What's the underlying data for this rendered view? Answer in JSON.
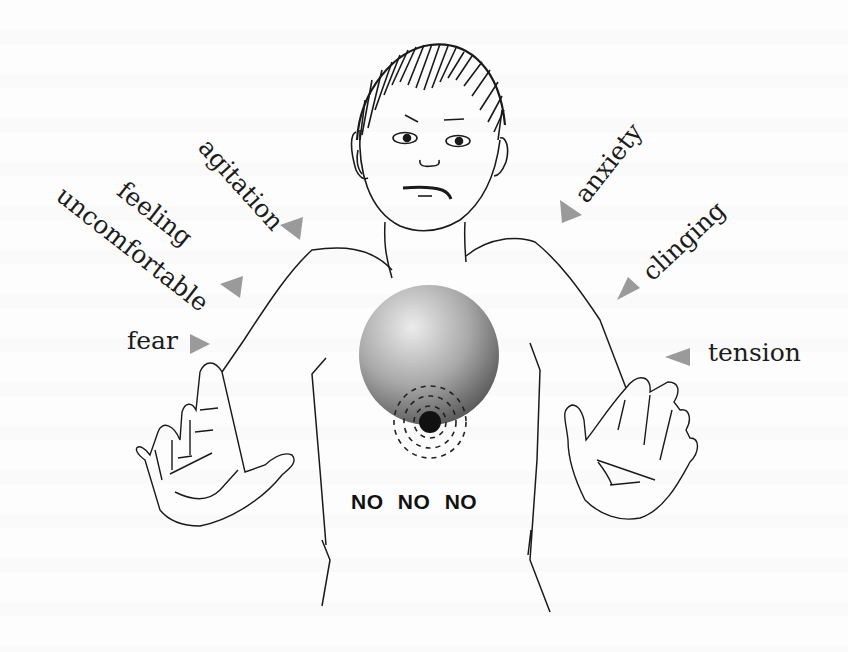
{
  "figure": {
    "labels": {
      "agitation": "agitation",
      "feeling": "feeling",
      "uncomfortable": "uncomfortable",
      "fear": "fear",
      "anxiety": "anxiety",
      "clinging": "clinging",
      "tension": "tension"
    },
    "center_text": "NO NO NO",
    "colors": {
      "arrow": "#9a9a9a",
      "ink": "#1c1c1c",
      "sphere_light": "#e8e8e8",
      "sphere_dark": "#5a5a5a",
      "dot": "#111111"
    }
  }
}
